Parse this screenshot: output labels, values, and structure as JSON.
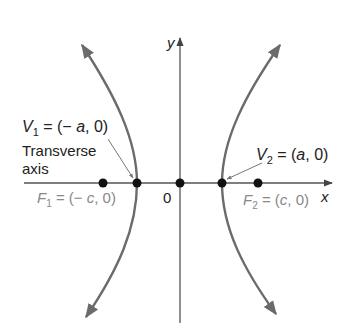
{
  "diagram": {
    "axes": {
      "x_label": "x",
      "y_label": "y",
      "origin_label": "0"
    },
    "labels": {
      "v1": {
        "name": "V",
        "sub": "1",
        "rest": " = (− ",
        "var": "a",
        "tail": ", 0)"
      },
      "v2": {
        "name": "V",
        "sub": "2",
        "rest": " = (",
        "var": "a",
        "tail": ", 0)"
      },
      "f1": {
        "name": "F",
        "sub": "1",
        "rest": " = (− ",
        "var": "c",
        "tail": ", 0)"
      },
      "f2": {
        "name": "F",
        "sub": "2",
        "rest": " = (",
        "var": "c",
        "tail": ", 0)"
      },
      "transverse_line1": "Transverse",
      "transverse_line2": "axis"
    },
    "colors": {
      "curve": "#6b6b6b",
      "axis": "#555555",
      "point": "#111111",
      "text_dark": "#222222",
      "text_gray": "#888888"
    }
  }
}
